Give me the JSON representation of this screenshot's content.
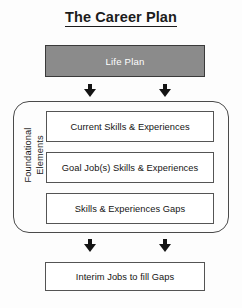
{
  "diagram": {
    "title": "The Career Plan",
    "top_node": {
      "label": "Life Plan",
      "fill_color": "#8b8b8b",
      "text_color": "#ffffff"
    },
    "group": {
      "label_line1": "Foundational",
      "label_line2": "Elements",
      "items": [
        {
          "label": "Current Skills & Experiences"
        },
        {
          "label": "Goal Job(s) Skills & Experiences"
        },
        {
          "label": "Skills & Experiences Gaps"
        }
      ]
    },
    "bottom_node": {
      "label": "Interim Jobs to fill Gaps"
    },
    "connectors": [
      {
        "name": "arrow-lifeplan-to-foundational-left",
        "direction": "down"
      },
      {
        "name": "arrow-lifeplan-to-foundational-right",
        "direction": "down"
      },
      {
        "name": "arrow-foundational-to-interim-left",
        "direction": "down"
      },
      {
        "name": "arrow-foundational-to-interim-right",
        "direction": "down"
      }
    ]
  }
}
